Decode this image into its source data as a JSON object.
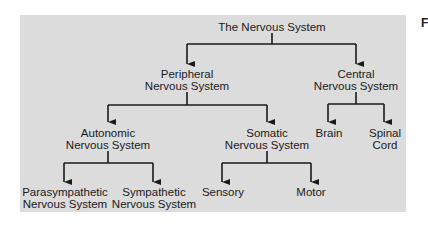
{
  "diagram": {
    "title": "The Nervous System",
    "background_color": "#dcdcdc",
    "line_color": "#1a1a1a",
    "nodes": {
      "root": {
        "line1": "The Nervous System"
      },
      "peripheral": {
        "line1": "Peripheral",
        "line2": "Nervous System"
      },
      "central": {
        "line1": "Central",
        "line2": "Nervous System"
      },
      "autonomic": {
        "line1": "Autonomic",
        "line2": "Nervous System"
      },
      "somatic": {
        "line1": "Somatic",
        "line2": "Nervous System"
      },
      "brain": {
        "line1": "Brain"
      },
      "spinal_cord": {
        "line1": "Spinal",
        "line2": "Cord"
      },
      "parasympathetic": {
        "line1": "Parasympathetic",
        "line2": "Nervous System"
      },
      "sympathetic": {
        "line1": "Sympathetic",
        "line2": "Nervous System"
      },
      "sensory": {
        "line1": "Sensory"
      },
      "motor": {
        "line1": "Motor"
      }
    },
    "edges": [
      [
        "root",
        "peripheral"
      ],
      [
        "root",
        "central"
      ],
      [
        "peripheral",
        "autonomic"
      ],
      [
        "peripheral",
        "somatic"
      ],
      [
        "central",
        "brain"
      ],
      [
        "central",
        "spinal_cord"
      ],
      [
        "autonomic",
        "parasympathetic"
      ],
      [
        "autonomic",
        "sympathetic"
      ],
      [
        "somatic",
        "sensory"
      ],
      [
        "somatic",
        "motor"
      ]
    ]
  },
  "figure_label": "F"
}
